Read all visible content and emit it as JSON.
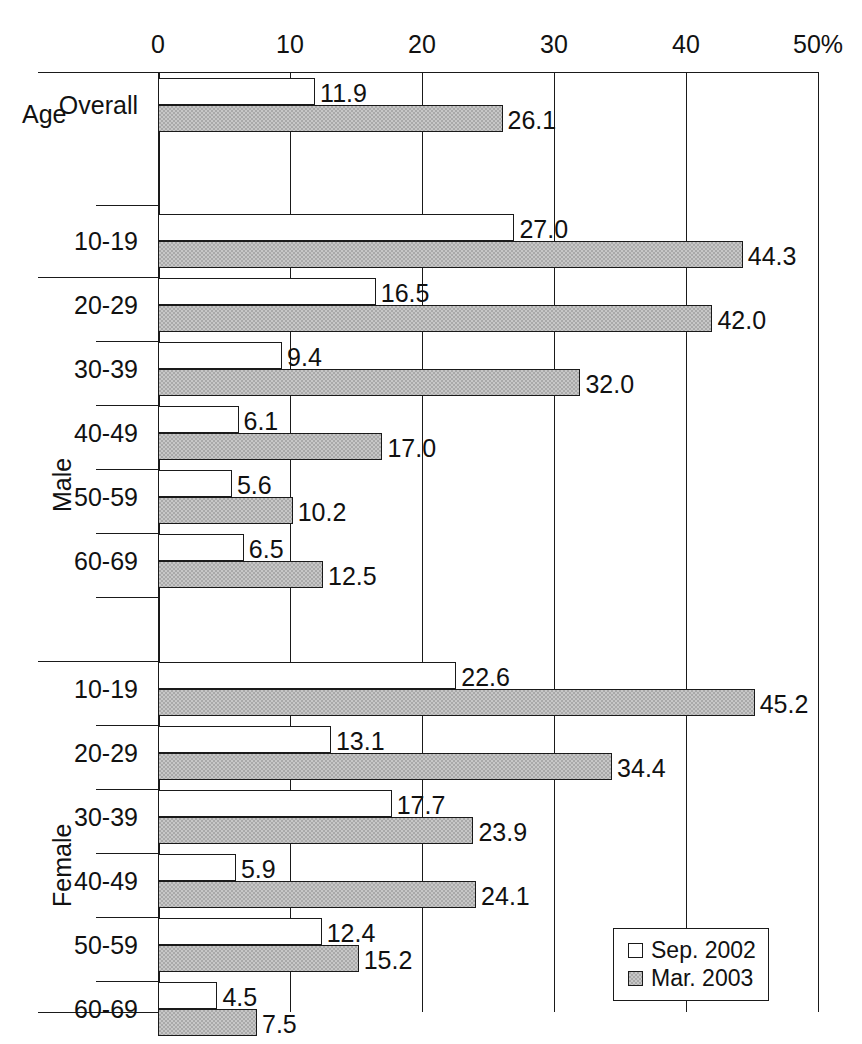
{
  "chart_data": {
    "type": "bar",
    "orientation": "horizontal",
    "title": "",
    "xlabel": "",
    "ylabel": "",
    "xlim": [
      0,
      50
    ],
    "xticks": [
      0,
      10,
      20,
      30,
      40,
      50
    ],
    "xticklabels": [
      "0",
      "10",
      "20",
      "30",
      "40",
      "50%"
    ],
    "grid": true,
    "legend_position": "bottom-right",
    "series": [
      {
        "name": "Sep. 2002",
        "style": "white",
        "values": [
          11.9,
          27.0,
          16.5,
          9.4,
          6.1,
          5.6,
          6.5,
          22.6,
          13.1,
          17.7,
          5.9,
          12.4,
          4.5
        ]
      },
      {
        "name": "Mar. 2003",
        "style": "gray",
        "values": [
          26.1,
          44.3,
          42.0,
          32.0,
          17.0,
          10.2,
          12.5,
          45.2,
          34.4,
          23.9,
          24.1,
          15.2,
          7.5
        ]
      }
    ],
    "categories": [
      "Overall",
      "10-19",
      "20-29",
      "30-39",
      "40-49",
      "50-59",
      "60-69",
      "10-19",
      "20-29",
      "30-39",
      "40-49",
      "50-59",
      "60-69"
    ],
    "groups": [
      {
        "label": "Age",
        "categories": [
          "Overall"
        ]
      },
      {
        "label": "Male",
        "categories": [
          "10-19",
          "20-29",
          "30-39",
          "40-49",
          "50-59",
          "60-69"
        ]
      },
      {
        "label": "Female",
        "categories": [
          "10-19",
          "20-29",
          "30-39",
          "40-49",
          "50-59",
          "60-69"
        ]
      }
    ]
  },
  "axis": {
    "ticks": [
      {
        "label": "0",
        "value": 0
      },
      {
        "label": "10",
        "value": 10
      },
      {
        "label": "20",
        "value": 20
      },
      {
        "label": "30",
        "value": 30
      },
      {
        "label": "40",
        "value": 40
      },
      {
        "label": "50%",
        "value": 50
      }
    ]
  },
  "groups": {
    "age": {
      "label": "Age"
    },
    "male": {
      "label": "Male"
    },
    "female": {
      "label": "Female"
    }
  },
  "rows": [
    {
      "id": "overall",
      "category": "Overall",
      "group": "Age",
      "light": "11.9",
      "dark": "26.1"
    },
    {
      "id": "m-10-19",
      "category": "10-19",
      "group": "Male",
      "light": "27.0",
      "dark": "44.3"
    },
    {
      "id": "m-20-29",
      "category": "20-29",
      "group": "Male",
      "light": "16.5",
      "dark": "42.0"
    },
    {
      "id": "m-30-39",
      "category": "30-39",
      "group": "Male",
      "light": "9.4",
      "dark": "32.0"
    },
    {
      "id": "m-40-49",
      "category": "40-49",
      "group": "Male",
      "light": "6.1",
      "dark": "17.0"
    },
    {
      "id": "m-50-59",
      "category": "50-59",
      "group": "Male",
      "light": "5.6",
      "dark": "10.2"
    },
    {
      "id": "m-60-69",
      "category": "60-69",
      "group": "Male",
      "light": "6.5",
      "dark": "12.5"
    },
    {
      "id": "f-10-19",
      "category": "10-19",
      "group": "Female",
      "light": "22.6",
      "dark": "45.2"
    },
    {
      "id": "f-20-29",
      "category": "20-29",
      "group": "Female",
      "light": "13.1",
      "dark": "34.4"
    },
    {
      "id": "f-30-39",
      "category": "30-39",
      "group": "Female",
      "light": "17.7",
      "dark": "23.9"
    },
    {
      "id": "f-40-49",
      "category": "40-49",
      "group": "Female",
      "light": "5.9",
      "dark": "24.1"
    },
    {
      "id": "f-50-59",
      "category": "50-59",
      "group": "Female",
      "light": "12.4",
      "dark": "15.2"
    },
    {
      "id": "f-60-69",
      "category": "60-69",
      "group": "Female",
      "light": "4.5",
      "dark": "7.5"
    }
  ],
  "legend": {
    "items": [
      {
        "label": "Sep. 2002",
        "style": "light"
      },
      {
        "label": "Mar. 2003",
        "style": "dark"
      }
    ]
  },
  "colors": {
    "line": "#1a1a1a",
    "series_light": "#ffffff",
    "series_dark": "#a9a9a9",
    "background": "#ffffff"
  }
}
